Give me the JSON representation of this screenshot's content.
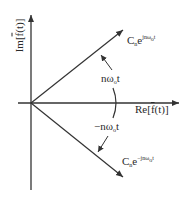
{
  "diagram": {
    "axes": {
      "x_label": {
        "prefix": "Re",
        "bracket_open": "[",
        "func": "f",
        "arg": "(t)",
        "bracket_close": "]"
      },
      "y_label": {
        "prefix": "Im",
        "bracket_open": "[",
        "func": "f",
        "arg": "(t)",
        "bracket_close": "]"
      }
    },
    "vectors": [
      {
        "name": "positive-frequency-phasor",
        "coef": "C",
        "coef_sub": "n",
        "base": "e",
        "exponent": "jnω",
        "exponent_sub": "o",
        "exponent_tail": "t"
      },
      {
        "name": "negative-frequency-phasor",
        "coef": "C",
        "coef_sub": "n",
        "base": "e",
        "exponent": "−jnω",
        "exponent_sub": "o",
        "exponent_tail": "t"
      }
    ],
    "angles": [
      {
        "name": "positive-angle",
        "prefix": "nω",
        "sub": "o",
        "tail": "t"
      },
      {
        "name": "negative-angle",
        "prefix": "−nω",
        "sub": "o",
        "tail": "t"
      }
    ],
    "colors": {
      "stroke": "#333333",
      "background": "#ffffff",
      "text": "#2a2a2a"
    }
  }
}
